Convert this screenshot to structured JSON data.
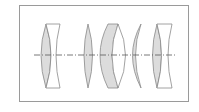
{
  "diagram": {
    "type": "optical-lens-cross-section",
    "frame_color": "#9a9a9a",
    "lens_fill": "#dcdcdc",
    "lens_stroke": "#8a8a8a",
    "axis_color": "#555555",
    "axis_style": "dash-dot",
    "elements": [
      {
        "id": "group-1",
        "parts": [
          "biconvex",
          "plano-concave"
        ]
      },
      {
        "id": "element-3",
        "parts": [
          "biconvex"
        ]
      },
      {
        "id": "element-4",
        "parts": [
          "positive-meniscus"
        ]
      },
      {
        "id": "element-5",
        "parts": [
          "meniscus"
        ]
      },
      {
        "id": "group-2",
        "parts": [
          "biconvex",
          "biconcave"
        ]
      }
    ]
  }
}
